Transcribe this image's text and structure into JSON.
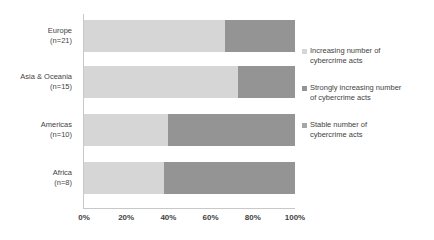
{
  "chart_data": {
    "type": "bar",
    "orientation": "horizontal",
    "stacked": "100%",
    "title": "",
    "xlabel": "",
    "ylabel": "",
    "xlim": [
      0,
      100
    ],
    "grid": false,
    "legend_position": "right",
    "categories": [
      "Europe\n(n=21)",
      "Asia & Oceania\n(n=15)",
      "Americas\n(n=10)",
      "Africa\n(n=8)"
    ],
    "category_lines": [
      [
        "Europe",
        "(n=21)"
      ],
      [
        "Asia & Oceania",
        "(n=15)"
      ],
      [
        "Americas",
        "(n=10)"
      ],
      [
        "Africa",
        "(n=8)"
      ]
    ],
    "xticks": [
      "0%",
      "20%",
      "40%",
      "60%",
      "80%",
      "100%"
    ],
    "xtick_values": [
      0,
      20,
      40,
      60,
      80,
      100
    ],
    "series": [
      {
        "name": "Increasing number of cybercrime acts",
        "color": "#d6d6d6",
        "values": [
          67,
          73,
          40,
          38
        ]
      },
      {
        "name": "Strongly increasing number of cybercrime acts",
        "color": "#949494",
        "values": [
          33,
          27,
          60,
          62
        ]
      },
      {
        "name": "Stable number of cybercrime acts",
        "color": "#a6a6a6",
        "values": [
          0,
          0,
          0,
          0
        ]
      }
    ]
  },
  "legend": {
    "items": [
      {
        "marker": "legend-swatch-increasing",
        "color": "#d6d6d6",
        "line1": "Increasing number of",
        "line2": "cybercrime acts"
      },
      {
        "marker": "legend-swatch-strongly-increasing",
        "color": "#949494",
        "line1": "Strongly increasing number",
        "line2": "of cybercrime acts"
      },
      {
        "marker": "legend-swatch-stable",
        "color": "#a6a6a6",
        "line1": "Stable number of",
        "line2": "cybercrime acts"
      }
    ]
  },
  "axis": {
    "line_color": "#c8c8c8"
  }
}
